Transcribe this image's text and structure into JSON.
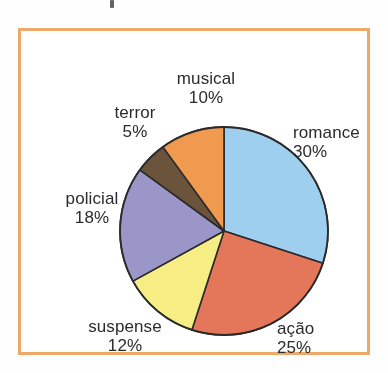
{
  "figure": {
    "frame_color": "#f0a868",
    "background_color": "#ffffff"
  },
  "chart_data": {
    "type": "pie",
    "title": "",
    "subtitle": "",
    "xlabel": "",
    "ylabel": "",
    "legend_position": "none",
    "grid": false,
    "labels_on_slices": false,
    "label_placement": "outside",
    "start_angle_deg": 0,
    "direction": "clockwise",
    "unit": "%",
    "categories": [
      "romance",
      "ação",
      "suspense",
      "policial",
      "terror",
      "musical"
    ],
    "values": [
      30,
      25,
      12,
      18,
      5,
      10
    ],
    "total": 100,
    "colors": [
      "#9fcfee",
      "#e4765a",
      "#f6ee85",
      "#9a96c8",
      "#6b533c",
      "#ef9a4e"
    ],
    "stroke_color": "#2b2b2b",
    "slices": [
      {
        "label": "romance",
        "percent_text": "30%",
        "value": 30,
        "color": "#9fcfee",
        "label_side": "right"
      },
      {
        "label": "ação",
        "percent_text": "25%",
        "value": 25,
        "color": "#e4765a",
        "label_side": "bottom-right"
      },
      {
        "label": "suspense",
        "percent_text": "12%",
        "value": 12,
        "color": "#f6ee85",
        "label_side": "bottom-left"
      },
      {
        "label": "policial",
        "percent_text": "18%",
        "value": 18,
        "color": "#9a96c8",
        "label_side": "left"
      },
      {
        "label": "terror",
        "percent_text": "5%",
        "value": 5,
        "color": "#6b533c",
        "label_side": "top-left"
      },
      {
        "label": "musical",
        "percent_text": "10%",
        "value": 10,
        "color": "#ef9a4e",
        "label_side": "top"
      }
    ]
  }
}
